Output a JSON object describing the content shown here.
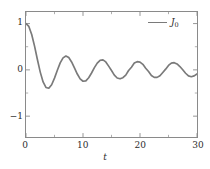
{
  "chart_data": {
    "type": "line",
    "title": "",
    "xlabel": "t",
    "ylabel": "",
    "xlim": [
      0,
      30
    ],
    "ylim": [
      -1.45,
      1.25
    ],
    "grid": false,
    "legend_position": "upper right",
    "series": [
      {
        "name": "J_0",
        "legend_label": "J",
        "legend_sub": "0",
        "color": "#7a7a7a",
        "x": [
          0,
          0.5,
          1,
          1.5,
          2,
          2.5,
          3,
          3.5,
          4,
          4.5,
          5,
          5.5,
          6,
          6.5,
          7,
          7.5,
          8,
          8.5,
          9,
          9.5,
          10,
          10.5,
          11,
          11.5,
          12,
          12.5,
          13,
          13.5,
          14,
          14.5,
          15,
          15.5,
          16,
          16.5,
          17,
          17.5,
          18,
          18.5,
          19,
          19.5,
          20,
          20.5,
          21,
          21.5,
          22,
          22.5,
          23,
          23.5,
          24,
          24.5,
          25,
          25.5,
          26,
          26.5,
          27,
          27.5,
          28,
          28.5,
          29,
          29.5,
          30
        ],
        "y": [
          1.0,
          0.9385,
          0.7652,
          0.5118,
          0.2239,
          -0.0484,
          -0.2601,
          -0.3801,
          -0.3971,
          -0.3205,
          -0.1776,
          -0.0068,
          0.1506,
          0.2601,
          0.3001,
          0.2663,
          0.1717,
          0.0419,
          -0.0903,
          -0.1939,
          -0.2459,
          -0.2366,
          -0.1712,
          -0.0677,
          0.0477,
          0.1469,
          0.2069,
          0.2167,
          0.1711,
          0.0804,
          -0.0142,
          -0.1128,
          -0.1749,
          -0.1928,
          -0.1699,
          -0.1142,
          -0.0134,
          0.0581,
          0.1466,
          0.1773,
          0.167,
          0.1199,
          0.0359,
          -0.0352,
          -0.1207,
          -0.1613,
          -0.1624,
          -0.1261,
          -0.0562,
          0.0153,
          0.0963,
          0.1457,
          0.156,
          0.1279,
          0.0717,
          0.0014,
          -0.073,
          -0.1307,
          -0.1478,
          -0.1305,
          -0.0862
        ]
      }
    ],
    "yticks": [
      {
        "value": 1,
        "label": "1"
      },
      {
        "value": 0,
        "label": "0"
      },
      {
        "value": -1,
        "label": "−1"
      }
    ],
    "yticks_minor": [
      0.5,
      -0.5
    ],
    "xticks": [
      {
        "value": 0,
        "label": "0"
      },
      {
        "value": 10,
        "label": "10"
      },
      {
        "value": 20,
        "label": "20"
      },
      {
        "value": 30,
        "label": "30"
      }
    ],
    "xticks_minor": [
      5,
      15,
      25
    ],
    "frame_color": "#8a8a8a",
    "background": "#ffffff"
  }
}
